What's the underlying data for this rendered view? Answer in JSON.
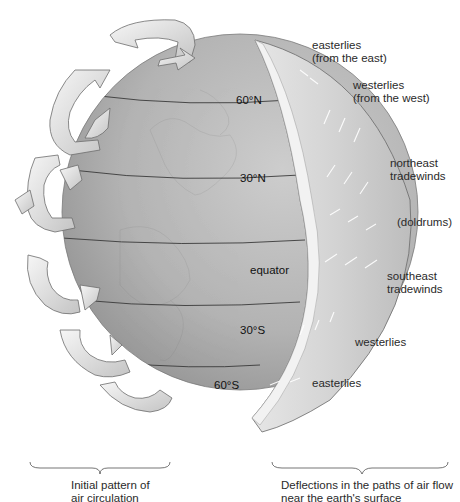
{
  "diagram": {
    "latitude_labels": [
      {
        "id": "60N",
        "text": "60°N"
      },
      {
        "id": "30N",
        "text": "30°N"
      },
      {
        "id": "equator",
        "text": "equator"
      },
      {
        "id": "30S",
        "text": "30°S"
      },
      {
        "id": "60S",
        "text": "60°S"
      }
    ],
    "wind_labels": [
      {
        "id": "polar-easterlies-north",
        "line1": "easterlies",
        "line2": "(from the east)"
      },
      {
        "id": "westerlies-north",
        "line1": "westerlies",
        "line2": "(from the west)"
      },
      {
        "id": "northeast-tradewinds",
        "line1": "northeast",
        "line2": "tradewinds"
      },
      {
        "id": "doldrums",
        "line1": "(doldrums)",
        "line2": ""
      },
      {
        "id": "southeast-tradewinds",
        "line1": "southeast",
        "line2": "tradewinds"
      },
      {
        "id": "westerlies-south",
        "line1": "westerlies",
        "line2": ""
      },
      {
        "id": "polar-easterlies-south",
        "line1": "easterlies",
        "line2": ""
      }
    ],
    "captions": {
      "left": {
        "line1": "Initial pattern of",
        "line2": "air circulation"
      },
      "right": {
        "line1": "Deflections in the paths of air flow",
        "line2": "near the earth's surface"
      }
    },
    "colors": {
      "globe_light": "#c9c9c9",
      "globe_dark": "#8a8a8a",
      "shell": "#dcdcdc",
      "arrow": "#ececec",
      "text": "#2a2a2a"
    }
  }
}
